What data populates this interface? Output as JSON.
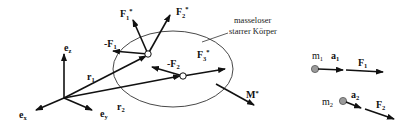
{
  "diagram": {
    "body_label": [
      "masseloser",
      "starrer Körper"
    ],
    "axes": {
      "ex": {
        "base": "e",
        "sub": "x"
      },
      "ey": {
        "base": "e",
        "sub": "y"
      },
      "ez": {
        "base": "e",
        "sub": "z"
      }
    },
    "position_vectors": {
      "r1": {
        "base": "r",
        "sub": "1"
      },
      "r2": {
        "base": "r",
        "sub": "2"
      }
    },
    "forces": {
      "F1_star": {
        "base": "F",
        "sub": "1",
        "sup": "*"
      },
      "F2_star": {
        "base": "F",
        "sub": "2",
        "sup": "*"
      },
      "F3_star": {
        "base": "F",
        "sub": "3",
        "sup": "*"
      },
      "neg_F1": {
        "prefix": "-",
        "base": "F",
        "sub": "1"
      },
      "neg_F2": {
        "prefix": "-",
        "base": "F",
        "sub": "2"
      },
      "M_star": {
        "base": "M",
        "sup": "*"
      }
    },
    "masses": [
      {
        "m": {
          "base": "m",
          "sub": "1"
        },
        "a": {
          "base": "a",
          "sub": "1"
        },
        "F": {
          "base": "F",
          "sub": "1"
        }
      },
      {
        "m": {
          "base": "m",
          "sub": "2"
        },
        "a": {
          "base": "a",
          "sub": "2"
        },
        "F": {
          "base": "F",
          "sub": "2"
        }
      }
    ],
    "colors": {
      "line": "#111111",
      "mass_fill": "#9a9a9a",
      "point_fill": "#ffffff"
    }
  }
}
